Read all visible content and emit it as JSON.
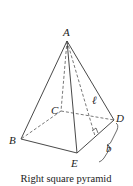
{
  "diagram": {
    "title": "Right square pyramid",
    "vertices": {
      "apex": "A",
      "base_back_left": "C",
      "base_right": "D",
      "base_left": "B",
      "base_front": "E"
    },
    "measurements": {
      "slant_height": "ℓ",
      "base_edge": "b"
    }
  }
}
